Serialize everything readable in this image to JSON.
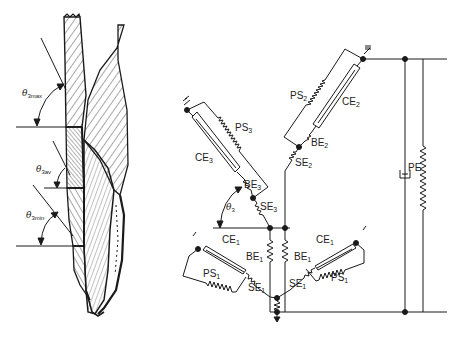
{
  "figure": {
    "left_panel": {
      "description": "muscle-drawing",
      "angle_labels": [
        {
          "symbol": "θ",
          "sub": "3max"
        },
        {
          "symbol": "θ",
          "sub": "3av"
        },
        {
          "symbol": "θ",
          "sub": "3min"
        }
      ]
    },
    "right_panel": {
      "description": "muscle-model-schematic",
      "branch3": {
        "PS": {
          "main": "PS",
          "sub": "3"
        },
        "CE": {
          "main": "CE",
          "sub": "3"
        },
        "BE": {
          "main": "BE",
          "sub": "3"
        },
        "SE": {
          "main": "SE",
          "sub": "3"
        },
        "angle": {
          "symbol": "θ",
          "sub": "3"
        }
      },
      "branch2": {
        "PS": {
          "main": "PS",
          "sub": "2"
        },
        "CE": {
          "main": "CE",
          "sub": "2"
        },
        "BE": {
          "main": "BE",
          "sub": "2"
        },
        "SE": {
          "main": "SE",
          "sub": "2"
        }
      },
      "branch1_left": {
        "CE": {
          "main": "CE",
          "sub": "1"
        },
        "BE": {
          "main": "BE",
          "sub": "1"
        },
        "PS": {
          "main": "PS",
          "sub": "1"
        },
        "SE": {
          "main": "SE",
          "sub": "1"
        }
      },
      "branch1_right": {
        "CE": {
          "main": "CE",
          "sub": "1"
        },
        "BE": {
          "main": "BE",
          "sub": "1"
        },
        "PS": {
          "main": "PS",
          "sub": "1"
        },
        "SE": {
          "main": "SE",
          "sub": "1"
        }
      },
      "parallel": {
        "main": "PE",
        "sub": ""
      }
    },
    "colors": {
      "ink": "#1a1a1a",
      "background": "#ffffff"
    }
  }
}
